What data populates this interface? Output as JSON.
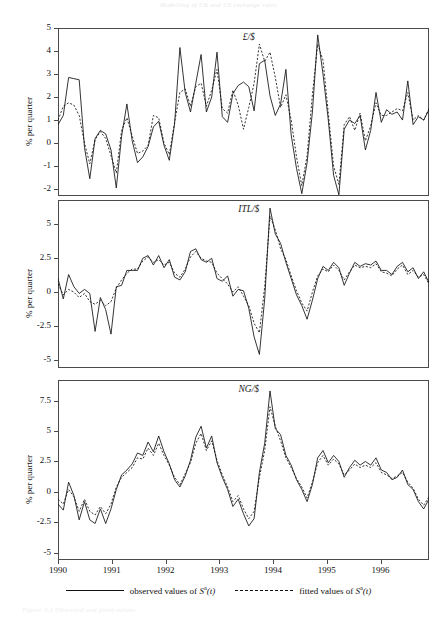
{
  "running_head": "Modelling of UK and US exchange rates",
  "caption": "Figure 9.1  Observed and fitted values",
  "axis": {
    "ylabel": "% per quarter",
    "xticks": [
      "1990",
      "1991",
      "1992",
      "1993",
      "1994",
      "1995",
      "1996"
    ]
  },
  "legend": {
    "observed": "observed values of ",
    "fitted": "fitted values of ",
    "symbol_base": "S",
    "symbol_sup": "a",
    "symbol_arg": "(t)"
  },
  "chart_data": {
    "type": "line",
    "title": "",
    "xlabel": "",
    "ylabel": "% per quarter",
    "grid": false,
    "legend_position": "bottom",
    "xlim": [
      1990.0,
      1996.9
    ],
    "xticks": [
      1990,
      1991,
      1992,
      1993,
      1994,
      1995,
      1996
    ],
    "panels": [
      {
        "name": "£/$",
        "ylabel": "% per quarter",
        "ylim": [
          -2.3,
          5.0
        ],
        "yticks": [
          5,
          4,
          3,
          2,
          1,
          0,
          -1,
          -2
        ],
        "series": [
          {
            "name": "observed values of S^a(t)",
            "style": "solid",
            "values": [
              0.8,
              1.2,
              2.85,
              2.8,
              2.75,
              -0.2,
              -1.55,
              0.2,
              0.55,
              0.4,
              -0.3,
              -1.95,
              0.3,
              1.7,
              0.1,
              -0.85,
              -0.6,
              -0.15,
              0.7,
              0.95,
              -0.1,
              -0.75,
              0.85,
              4.15,
              2.2,
              1.35,
              2.6,
              3.85,
              1.35,
              2.0,
              3.95,
              1.15,
              0.9,
              2.15,
              2.5,
              2.65,
              2.45,
              1.4,
              3.45,
              3.6,
              2.05,
              1.2,
              1.7,
              3.2,
              0.35,
              -1.1,
              -2.2,
              -0.85,
              1.35,
              4.7,
              3.0,
              1.0,
              -1.4,
              -2.25,
              0.6,
              1.0,
              0.85,
              1.2,
              -0.3,
              0.55,
              2.2,
              0.9,
              1.45,
              1.25,
              1.35,
              1.0,
              2.7,
              0.8,
              1.15,
              1.0,
              1.45
            ]
          },
          {
            "name": "fitted values of S^a(t)",
            "style": "dashed",
            "values": [
              1.0,
              1.6,
              1.75,
              1.65,
              1.2,
              0.0,
              -0.9,
              0.15,
              0.5,
              0.2,
              -0.55,
              -1.3,
              0.55,
              1.1,
              0.3,
              -0.45,
              -0.35,
              -0.1,
              1.2,
              1.1,
              0.0,
              -0.5,
              0.9,
              2.2,
              2.35,
              1.6,
              2.45,
              2.6,
              1.6,
              2.3,
              3.2,
              1.5,
              1.3,
              2.3,
              1.65,
              0.6,
              1.55,
              2.6,
              4.3,
              3.55,
              3.95,
              2.85,
              1.55,
              2.1,
              1.0,
              -0.6,
              -1.85,
              -0.55,
              2.1,
              4.3,
              3.6,
              1.3,
              -1.0,
              -1.8,
              0.8,
              1.15,
              0.55,
              1.3,
              0.1,
              0.75,
              1.75,
              1.2,
              1.2,
              1.35,
              1.5,
              1.4,
              2.2,
              1.0,
              1.2,
              1.0,
              1.5
            ]
          }
        ]
      },
      {
        "name": "ITL/$",
        "ylabel": "% per quarter",
        "ylim": [
          -5.6,
          6.8
        ],
        "yticks": [
          5.0,
          2.5,
          0.0,
          -2.5,
          -5.0
        ],
        "series": [
          {
            "name": "observed values of S^a(t)",
            "style": "solid",
            "values": [
              1.0,
              -0.5,
              1.3,
              0.4,
              -0.1,
              0.2,
              -0.1,
              -2.9,
              -0.4,
              -1.3,
              -3.1,
              0.4,
              0.5,
              1.6,
              1.6,
              1.6,
              2.5,
              2.7,
              2.0,
              2.7,
              1.8,
              2.4,
              1.1,
              0.9,
              1.5,
              3.0,
              3.2,
              2.4,
              2.2,
              2.5,
              1.0,
              0.8,
              1.2,
              -0.3,
              0.2,
              0.1,
              -1.2,
              -3.3,
              -4.6,
              -0.5,
              6.2,
              4.3,
              3.6,
              2.2,
              1.0,
              -0.2,
              -1.0,
              -2.0,
              -0.6,
              1.0,
              1.9,
              1.6,
              2.2,
              1.8,
              0.5,
              1.4,
              2.2,
              1.9,
              2.1,
              2.0,
              2.3,
              1.6,
              1.6,
              1.3,
              1.9,
              2.2,
              1.5,
              1.8,
              1.0,
              1.5,
              0.7
            ]
          },
          {
            "name": "fitted values of S^a(t)",
            "style": "dashed",
            "values": [
              0.6,
              -0.2,
              0.2,
              0.0,
              -0.4,
              -0.1,
              -0.7,
              -0.9,
              -0.6,
              -1.0,
              -0.7,
              0.3,
              0.9,
              1.4,
              1.7,
              1.7,
              2.3,
              2.6,
              2.2,
              2.4,
              2.0,
              2.2,
              1.4,
              1.1,
              1.7,
              2.6,
              3.0,
              2.5,
              2.3,
              2.2,
              1.4,
              1.0,
              0.6,
              0.0,
              0.4,
              -0.3,
              -1.0,
              -2.3,
              -3.0,
              0.4,
              5.6,
              4.6,
              3.2,
              2.4,
              1.2,
              0.1,
              -0.8,
              -1.4,
              0.0,
              1.2,
              1.7,
              1.5,
              2.0,
              1.6,
              0.9,
              1.5,
              2.0,
              1.8,
              1.9,
              1.8,
              2.1,
              1.5,
              1.4,
              1.2,
              1.7,
              2.0,
              1.3,
              1.6,
              1.1,
              1.3,
              0.6
            ]
          }
        ]
      },
      {
        "name": "NG/$",
        "ylabel": "% per quarter",
        "ylim": [
          -5.6,
          9.2
        ],
        "yticks": [
          7.5,
          5.0,
          2.5,
          0.0,
          -2.5,
          -5.0
        ],
        "series": [
          {
            "name": "observed values of S^a(t)",
            "style": "solid",
            "values": [
              -1.0,
              -1.5,
              0.8,
              -0.3,
              -2.3,
              -0.8,
              -2.3,
              -2.6,
              -1.4,
              -2.6,
              -1.4,
              0.2,
              1.4,
              1.8,
              2.3,
              3.2,
              3.0,
              4.1,
              3.3,
              4.6,
              3.3,
              2.3,
              1.0,
              0.4,
              1.3,
              2.6,
              4.5,
              5.4,
              3.6,
              4.6,
              2.4,
              1.2,
              0.2,
              -1.2,
              -0.6,
              -1.8,
              -2.8,
              -2.2,
              1.6,
              4.0,
              8.3,
              5.2,
              4.7,
              3.0,
              2.2,
              1.0,
              0.2,
              -0.8,
              0.6,
              2.8,
              3.4,
              2.4,
              3.0,
              2.5,
              1.2,
              2.0,
              2.6,
              2.2,
              2.5,
              2.2,
              2.8,
              1.8,
              1.6,
              1.0,
              1.2,
              1.8,
              0.6,
              0.2,
              -0.8,
              -1.4,
              -0.6
            ]
          },
          {
            "name": "fitted values of S^a(t)",
            "style": "dashed",
            "values": [
              -0.6,
              -1.0,
              0.2,
              -0.4,
              -1.6,
              -0.6,
              -1.6,
              -1.9,
              -1.2,
              -1.8,
              -1.0,
              0.4,
              1.2,
              1.6,
              2.0,
              2.8,
              2.7,
              3.6,
              3.0,
              4.0,
              3.0,
              2.2,
              1.2,
              0.6,
              1.5,
              2.4,
              4.0,
              4.8,
              3.4,
              4.2,
              2.6,
              1.4,
              0.4,
              -0.8,
              -0.3,
              -1.4,
              -2.2,
              -1.6,
              1.2,
              3.4,
              7.0,
              5.4,
              4.2,
              2.8,
              2.0,
              1.1,
              0.4,
              -0.5,
              0.8,
              2.4,
              3.0,
              2.2,
              2.7,
              2.3,
              1.4,
              1.8,
              2.3,
              2.0,
              2.2,
              2.0,
              2.4,
              1.6,
              1.4,
              1.1,
              1.3,
              1.6,
              0.8,
              0.3,
              -0.6,
              -1.1,
              -0.4
            ]
          }
        ]
      }
    ]
  }
}
